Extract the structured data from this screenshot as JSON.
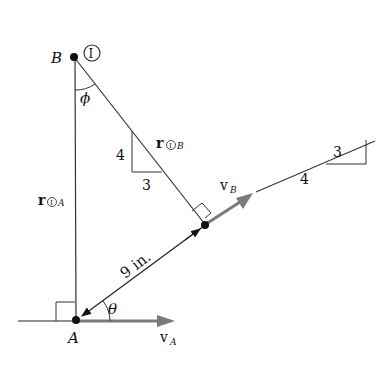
{
  "diagram": {
    "points": {
      "B": {
        "label": "B"
      },
      "A": {
        "label": "A"
      },
      "instant_center": {
        "label": "I"
      }
    },
    "labels": {
      "phi": "ϕ",
      "theta": "θ",
      "distance": "9 in.",
      "r_IB": "r",
      "r_IB_sub": "B",
      "r_IA": "r",
      "r_IA_sub": "A",
      "circled_I": "I",
      "vB": "v",
      "vB_sub": "B",
      "vA": "v",
      "vA_sub": "A"
    },
    "slope_triangle_rod": {
      "rise": "4",
      "run": "3"
    },
    "slope_triangle_incline": {
      "rise": "3",
      "run": "4"
    },
    "colors": {
      "line": "#222222",
      "velocity_arrow": "#7a7a7a",
      "point": "#111111"
    }
  }
}
